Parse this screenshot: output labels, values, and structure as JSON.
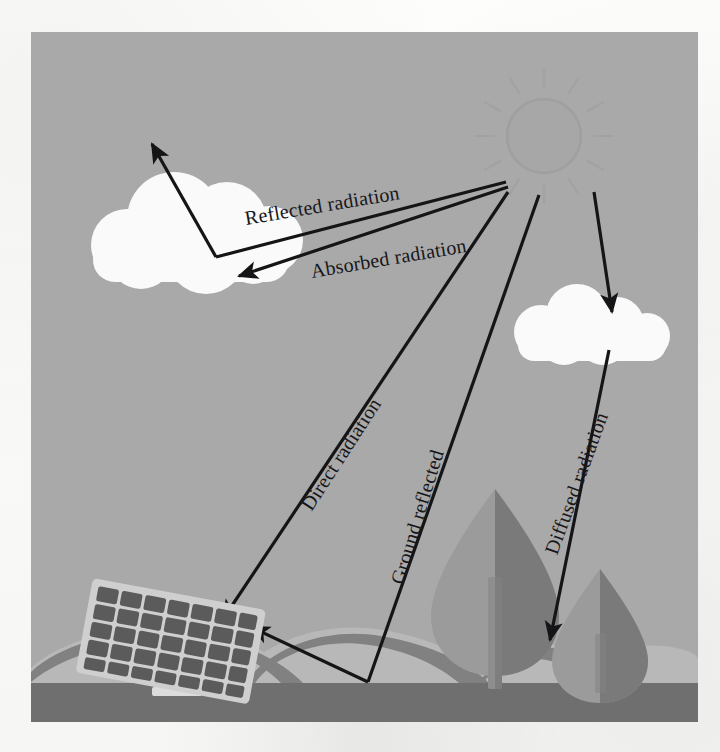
{
  "figure": {
    "background_color": "#a9a9a9",
    "ground_color": "#6f6f6f",
    "mound_color": "#b9b9b9",
    "mound_shadow_color": "#7f7f7f",
    "cloud_color": "#fbfbfb",
    "line_color": "#151518",
    "sun": {
      "name": "sun",
      "fill": "#a4a4a4",
      "stroke": "#9a9a9a",
      "cx": 513,
      "cy": 104,
      "r": 37,
      "rays": 12
    },
    "labels": [
      {
        "id": "reflected",
        "text": "Reflected radiation"
      },
      {
        "id": "absorbed",
        "text": "Absorbed radiation"
      },
      {
        "id": "direct",
        "text": "Direct radiation"
      },
      {
        "id": "ground",
        "text": "Ground reflected"
      },
      {
        "id": "diffused",
        "text": "Diffused radiation"
      }
    ],
    "clouds": [
      {
        "id": "cloud-left",
        "name": "cloud-left"
      },
      {
        "id": "cloud-right",
        "name": "cloud-right"
      }
    ],
    "solar_panel": {
      "name": "solar-panel",
      "frame_color": "#cfcfcf",
      "cell_color": "#5d5d5d",
      "cell_columns": 7,
      "cell_rows": 5,
      "post_color": "#d2d2d2"
    },
    "trees": [
      {
        "id": "tree-large",
        "leaf_light": "#9c9c9c",
        "leaf_dark": "#7a7a7a",
        "trunk": "#8d8d8d"
      },
      {
        "id": "tree-small",
        "leaf_light": "#9c9c9c",
        "leaf_dark": "#7a7a7a",
        "trunk": "#8d8d8d"
      }
    ],
    "rays": [
      {
        "id": "reflected-ray",
        "from": "sun",
        "to": "cloud-left",
        "then": "up-left",
        "arrow": "up-left"
      },
      {
        "id": "absorbed-ray",
        "from": "sun",
        "to": "cloud-left",
        "arrow": "into-cloud"
      },
      {
        "id": "direct-ray",
        "from": "sun",
        "to": "solar-panel",
        "arrow": "onto-panel"
      },
      {
        "id": "ground-reflected-ray",
        "from": "sun",
        "to": "ground",
        "then": "solar-panel",
        "arrow": "onto-panel"
      },
      {
        "id": "diffused-ray",
        "from": "sun",
        "to": "cloud-right",
        "then": "ground",
        "arrow": "onto-ground"
      }
    ]
  }
}
